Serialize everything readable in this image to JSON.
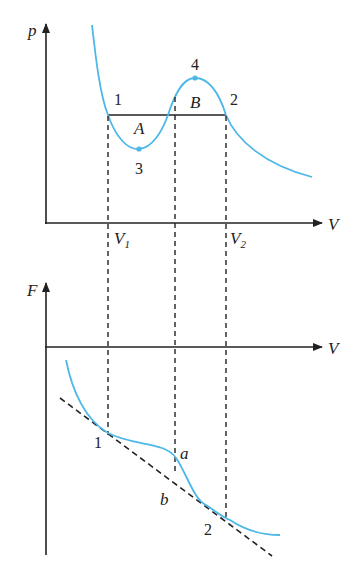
{
  "top_plot": {
    "y_axis_label": "p",
    "x_axis_label": "V",
    "points": {
      "p1": "1",
      "p2": "2",
      "p3": "3",
      "p4": "4"
    },
    "regions": {
      "A": "A",
      "B": "B"
    },
    "ticks": {
      "v1": "V",
      "v1_sub": "1",
      "v2": "V",
      "v2_sub": "2"
    }
  },
  "bottom_plot": {
    "y_axis_label": "F",
    "x_axis_label": "V",
    "points": {
      "p1": "1",
      "p2": "2",
      "a": "a",
      "b": "b"
    }
  },
  "colors": {
    "curve": "#4db8e8",
    "axis": "#222222"
  }
}
